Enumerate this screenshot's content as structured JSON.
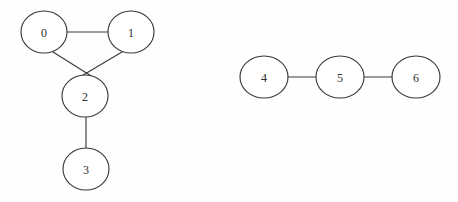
{
  "chart_data": {
    "type": "diagram",
    "diagram_kind": "undirected-graph",
    "title": "",
    "components": 2,
    "background_color": "#fefefe",
    "stroke_color": "#3b3b3b",
    "label_color": "#2e2e2e",
    "node_fill": "#ffffff",
    "node_radius": 23,
    "nodes": [
      {
        "id": "0",
        "label": "0",
        "cx": 44,
        "cy": 32,
        "rx": 23,
        "ry": 21,
        "component": 1
      },
      {
        "id": "1",
        "label": "1",
        "cx": 131,
        "cy": 32,
        "rx": 23,
        "ry": 21,
        "component": 1
      },
      {
        "id": "2",
        "label": "2",
        "cx": 85,
        "cy": 96,
        "rx": 23,
        "ry": 21,
        "component": 1
      },
      {
        "id": "3",
        "label": "3",
        "cx": 86,
        "cy": 169,
        "rx": 23,
        "ry": 21,
        "component": 1
      },
      {
        "id": "4",
        "label": "4",
        "cx": 264,
        "cy": 77,
        "rx": 24,
        "ry": 21,
        "component": 2
      },
      {
        "id": "5",
        "label": "5",
        "cx": 340,
        "cy": 77,
        "rx": 24,
        "ry": 21,
        "component": 2
      },
      {
        "id": "6",
        "label": "6",
        "cx": 416,
        "cy": 77,
        "rx": 24,
        "ry": 21,
        "component": 2
      }
    ],
    "edges": [
      {
        "source": "0",
        "target": "1",
        "x1": 67,
        "y1": 32,
        "x2": 108,
        "y2": 32
      },
      {
        "source": "0",
        "target": "2",
        "x1": 53,
        "y1": 52,
        "x2": 104,
        "y2": 84
      },
      {
        "source": "1",
        "target": "2",
        "x1": 122,
        "y1": 52,
        "x2": 68,
        "y2": 84
      },
      {
        "source": "2",
        "target": "3",
        "x1": 86,
        "y1": 117,
        "x2": 86,
        "y2": 148
      },
      {
        "source": "4",
        "target": "5",
        "x1": 288,
        "y1": 77,
        "x2": 316,
        "y2": 77
      },
      {
        "source": "5",
        "target": "6",
        "x1": 364,
        "y1": 77,
        "x2": 392,
        "y2": 77
      }
    ],
    "adjacency": {
      "0": [
        "1",
        "2"
      ],
      "1": [
        "0",
        "2"
      ],
      "2": [
        "0",
        "1",
        "3"
      ],
      "3": [
        "2"
      ],
      "4": [
        "5"
      ],
      "5": [
        "4",
        "6"
      ],
      "6": [
        "5"
      ]
    },
    "node_count": 7,
    "edge_count": 6
  }
}
